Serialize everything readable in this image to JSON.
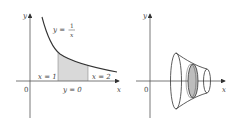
{
  "figure_left": {
    "axis_x_label": "x",
    "axis_y_label": "y",
    "origin_label": "0",
    "curve_label_lhs": "y =",
    "curve_label_num": "1",
    "curve_label_den": "x",
    "bound_left_label": "x = 1",
    "bound_right_label": "x = 2",
    "bottom_bound_label": "y = 0",
    "shade_color": "#d9d9d9",
    "line_color": "#333333"
  },
  "figure_right": {
    "axis_x_label": "x",
    "axis_y_label": "y",
    "origin_label": "0",
    "disk_color": "#bdbdbd",
    "line_color": "#333333"
  }
}
